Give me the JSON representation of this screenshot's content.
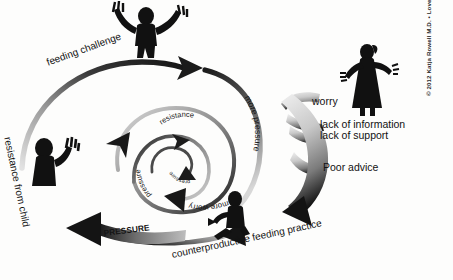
{
  "diagram": {
    "background_color": "#fdfdfc",
    "ink_color": "#111111",
    "outer_labels": {
      "top_left": "feeding challenge",
      "left": "resistance from child",
      "bottom": "counterproductive feeding practice",
      "pressure_band": "PRESSURE"
    },
    "spiral_labels": {
      "ring_right_outer": "more pressure",
      "ring_bottom_outer": "more worry",
      "ring_top_inner": "resistance",
      "ring_left_inner": "pressure",
      "core_inner": "pressure"
    },
    "input_labels": [
      {
        "id": "worry",
        "text": "worry"
      },
      {
        "id": "lack-of-information",
        "text": "lack of information"
      },
      {
        "id": "lack-of-support",
        "text": "lack of support"
      },
      {
        "id": "poor-advice",
        "text": "Poor advice"
      }
    ],
    "figures": [
      {
        "id": "child-arms-raised",
        "name": "child-silhouette-arms-raised"
      },
      {
        "id": "adult-caregiver",
        "name": "adult-caregiver-silhouette"
      },
      {
        "id": "child-resisting",
        "name": "child-silhouette-hand-up"
      },
      {
        "id": "child-being-fed",
        "name": "child-silhouette-seated-feeding"
      }
    ],
    "credit": "© 2012 Katja Rowell M.D.  •  Love Me, Feed Me"
  }
}
